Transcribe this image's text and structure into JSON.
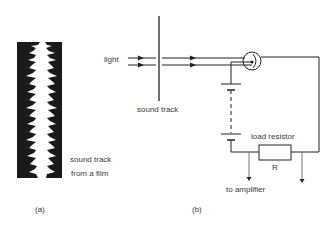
{
  "panel_a": {
    "label": "(a)",
    "caption_line1": "sound track",
    "caption_line2": "from a film"
  },
  "panel_b": {
    "label": "(b)",
    "light_label": "light",
    "sound_track_label": "sound track",
    "load_resistor_label": "load resistor",
    "resistor_symbol": "R",
    "amplifier_label": "to amplifier"
  },
  "colors": {
    "ink": "#222222",
    "film": "#1a1a1a",
    "background": "#ffffff"
  }
}
